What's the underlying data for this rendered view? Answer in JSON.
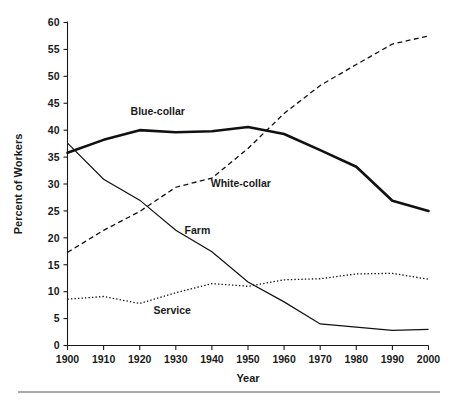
{
  "chart_data": {
    "type": "line",
    "title": "",
    "xlabel": "Year",
    "ylabel": "Percent of Workers",
    "xlim": [
      1900,
      2000
    ],
    "ylim": [
      0,
      60
    ],
    "grid": false,
    "legend": "inline-labels",
    "x": [
      1900,
      1910,
      1920,
      1930,
      1940,
      1950,
      1960,
      1970,
      1980,
      1990,
      2000
    ],
    "xticklabels": [
      "1900",
      "1910",
      "1920",
      "1930",
      "1940",
      "1950",
      "1960",
      "1970",
      "1980",
      "1990",
      "2000"
    ],
    "yticks": [
      0,
      5,
      10,
      15,
      20,
      25,
      30,
      35,
      40,
      45,
      50,
      55,
      60
    ],
    "yticklabels": [
      "0",
      "5",
      "10",
      "15",
      "20",
      "25",
      "30",
      "35",
      "40",
      "45",
      "50",
      "55",
      "60"
    ],
    "series": [
      {
        "name": "Blue-collar",
        "style": "solid-thick",
        "label_x": 1925,
        "label_y": 43.5,
        "values": [
          35.8,
          38.2,
          40.0,
          39.6,
          39.8,
          40.6,
          39.3,
          36.3,
          33.2,
          26.9,
          25.0
        ]
      },
      {
        "name": "White-collar",
        "style": "dashed",
        "label_x": 1948,
        "label_y": 30.2,
        "values": [
          17.3,
          21.4,
          24.9,
          29.4,
          31.1,
          36.6,
          43.1,
          48.3,
          52.2,
          56.0,
          57.5
        ]
      },
      {
        "name": "Farm",
        "style": "solid-thin",
        "label_x": 1936,
        "label_y": 21.4,
        "values": [
          37.6,
          30.9,
          27.0,
          21.4,
          17.4,
          11.8,
          8.1,
          4.0,
          3.4,
          2.8,
          3.0
        ]
      },
      {
        "name": "Service",
        "style": "dotted",
        "label_x": 1929,
        "label_y": 6.6,
        "values": [
          8.6,
          9.1,
          7.8,
          9.8,
          11.5,
          11.0,
          12.2,
          12.4,
          13.3,
          13.4,
          12.3
        ]
      }
    ],
    "annotations": [
      {
        "text": "Blue-collar",
        "x": 1925,
        "y": 43.5
      },
      {
        "text": "White-collar",
        "x": 1948,
        "y": 30.2
      },
      {
        "text": "Farm",
        "x": 1936,
        "y": 21.4
      },
      {
        "text": "Service",
        "x": 1929,
        "y": 6.6
      }
    ]
  },
  "figure": {
    "axis_color": "#1a1a1a",
    "line_color": "#111111",
    "background": "#ffffff",
    "footer_rule_color": "#555555"
  }
}
